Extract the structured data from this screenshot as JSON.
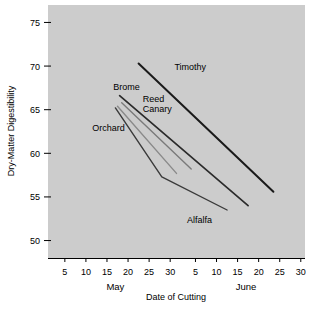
{
  "chart_data": {
    "type": "line",
    "title": "",
    "xlabel": "Date of Cutting",
    "ylabel": "Dry-Matter Digestibility",
    "grid": false,
    "legend_position": "inline-labels",
    "background_color": "#cccccc",
    "ylim": [
      48,
      77
    ],
    "yticks": [
      50,
      55,
      60,
      65,
      70,
      75
    ],
    "ytick_labels": [
      "50",
      "55",
      "60",
      "65",
      "70",
      "75"
    ],
    "xlim": [
      1,
      62
    ],
    "xticks": [
      5,
      10,
      15,
      20,
      25,
      30,
      36,
      41,
      46,
      51,
      56,
      61
    ],
    "xtick_labels": [
      "5",
      "10",
      "15",
      "20",
      "25",
      "30",
      "5",
      "10",
      "15",
      "20",
      "25",
      "30"
    ],
    "month_labels": [
      {
        "text": "May",
        "x": 17
      },
      {
        "text": "June",
        "x": 48
      }
    ],
    "series": [
      {
        "name": "Timothy",
        "color": "#1a1a1a",
        "width": 2.0,
        "label_x": 31,
        "label_y": 69.6,
        "points": [
          {
            "x": 22.5,
            "y": 70.3
          },
          {
            "x": 54.5,
            "y": 55.6
          }
        ]
      },
      {
        "name": "Brome",
        "color": "#2b2b2b",
        "width": 1.7,
        "label_x": 16.5,
        "label_y": 67.2,
        "points": [
          {
            "x": 18.0,
            "y": 66.6
          },
          {
            "x": 48.5,
            "y": 54.0
          }
        ]
      },
      {
        "name": "Reed Canary",
        "color": "#7a7a7a",
        "width": 1.4,
        "label_x": 23.5,
        "label_y": 65.9,
        "points": [
          {
            "x": 18.5,
            "y": 65.8
          },
          {
            "x": 35.0,
            "y": 58.2
          }
        ]
      },
      {
        "name": "Orchard",
        "color": "#8a8a8a",
        "width": 1.4,
        "label_x": 11.5,
        "label_y": 62.6,
        "points": [
          {
            "x": 17.5,
            "y": 65.4
          },
          {
            "x": 31.5,
            "y": 57.7
          }
        ]
      },
      {
        "name": "Alfalfa",
        "color": "#3a3a3a",
        "width": 1.4,
        "label_x": 34.0,
        "label_y": 52.0,
        "points": [
          {
            "x": 17.0,
            "y": 65.2
          },
          {
            "x": 28.0,
            "y": 57.3
          },
          {
            "x": 43.5,
            "y": 53.5
          }
        ]
      }
    ]
  }
}
